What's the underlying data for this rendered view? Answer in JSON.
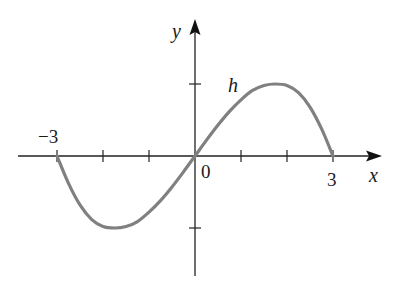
{
  "chart_data": {
    "type": "line",
    "title": "",
    "xlabel": "x",
    "ylabel": "y",
    "function_label": "h",
    "x_tick_labels": [
      "−3",
      "0",
      "3"
    ],
    "x_ticks": [
      -3,
      -2,
      -1,
      0,
      1,
      2,
      3
    ],
    "y_ticks": [
      -1,
      1
    ],
    "xlim": [
      -3.3,
      4
    ],
    "ylim": [
      -1.6,
      1.85
    ],
    "grid": false,
    "legend": "none",
    "series": [
      {
        "name": "h",
        "x": [
          -3,
          -2.75,
          -2.5,
          -2.25,
          -2,
          -1.74,
          -1.5,
          -1.25,
          -1,
          -0.75,
          -0.5,
          -0.25,
          0,
          0.25,
          0.5,
          0.75,
          1,
          1.25,
          1.5,
          1.74,
          2,
          2.25,
          2.5,
          2.75,
          3
        ],
        "values": [
          0,
          -0.38,
          -0.68,
          -0.88,
          -0.98,
          -1,
          -0.98,
          -0.91,
          -0.78,
          -0.62,
          -0.43,
          -0.22,
          0,
          0.22,
          0.43,
          0.62,
          0.78,
          0.91,
          0.98,
          1,
          0.98,
          0.88,
          0.68,
          0.38,
          0
        ]
      }
    ],
    "notable_points": {
      "x_intercepts": [
        -3,
        0,
        3
      ],
      "local_max": {
        "x": 1.74,
        "y": 1
      },
      "local_min": {
        "x": -1.74,
        "y": -1
      }
    },
    "colors": {
      "axis": "#222222",
      "curve": "#808080"
    }
  },
  "labels": {
    "y_axis": "y",
    "x_axis": "x",
    "curve": "h",
    "tick_neg3": "−3",
    "tick_0": "0",
    "tick_3": "3"
  }
}
